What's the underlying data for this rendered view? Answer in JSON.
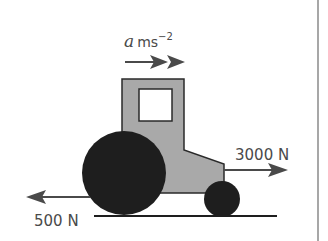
{
  "diagram": {
    "acceleration_label": {
      "symbol": "a",
      "unit": "ms",
      "exponent": "−2"
    },
    "forces": [
      {
        "name": "driving force",
        "label": "3000 N",
        "direction": "right"
      },
      {
        "name": "resistance",
        "label": "500 N",
        "direction": "left"
      }
    ],
    "colors": {
      "body": "#a9a9a9",
      "wheels": "#1e1e1e",
      "outline": "#2a2a2a",
      "arrows": "#4a4a4a",
      "rule": "#8a8a8a"
    }
  }
}
